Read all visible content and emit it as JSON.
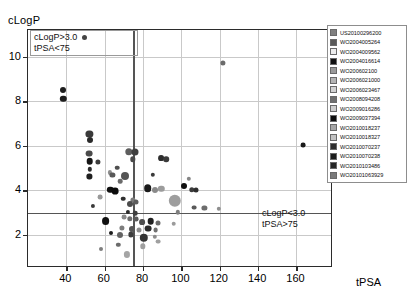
{
  "chart_data": {
    "type": "scatter",
    "title": "",
    "xlabel": "tPSA",
    "ylabel": "cLogP",
    "xlim": [
      20,
      178
    ],
    "ylim": [
      0.6,
      11.2
    ],
    "xticks": [
      40,
      60,
      80,
      100,
      120,
      140,
      160
    ],
    "yticks": [
      2,
      4,
      6,
      8,
      10
    ],
    "grid": true,
    "legend_position": "right-outside",
    "thresholds": {
      "vertical_x": 75,
      "vertical_label": "tPSA = 75",
      "horizontal_y": 3.0,
      "horizontal_label": "cLogP = 3.0"
    },
    "annotations": [
      {
        "id": "upper-left",
        "line1": "cLogP>3.0",
        "line2": "tPSA<75",
        "marker": true
      },
      {
        "id": "lower-right",
        "line1": "cLogP<3.0",
        "line2": "tPSA>75",
        "marker": false
      }
    ],
    "legend_entries": [
      {
        "label": "US20100296200",
        "color": "#808080"
      },
      {
        "label": "WO2004005264",
        "color": "#5a5a5a"
      },
      {
        "label": "WO2004009562",
        "color": "#ededed"
      },
      {
        "label": "WO2004016614",
        "color": "#111111"
      },
      {
        "label": "WO200602100",
        "color": "#9a9a9a"
      },
      {
        "label": "WO2006021000",
        "color": "#b4b4b4"
      },
      {
        "label": "WO2006023467",
        "color": "#d2d2d2"
      },
      {
        "label": "WO2008094208",
        "color": "#6e6e6e"
      },
      {
        "label": "WO2009016286",
        "color": "#cccccc"
      },
      {
        "label": "WO2009037394",
        "color": "#0d0d0d"
      },
      {
        "label": "WO2010018237",
        "color": "#a6a6a6"
      },
      {
        "label": "WO2010018327",
        "color": "#c2c2c2"
      },
      {
        "label": "WO2010070237",
        "color": "#2e2e2e"
      },
      {
        "label": "WO2010070238",
        "color": "#1c1c1c"
      },
      {
        "label": "WO2010103486",
        "color": "#262626"
      },
      {
        "label": "WO20101063929",
        "color": "#7a7a7a"
      }
    ],
    "points": [
      {
        "x": 38.5,
        "y": 8.52,
        "r": 3.0,
        "c": "#1d1d1d"
      },
      {
        "x": 38.5,
        "y": 8.12,
        "r": 3.2,
        "c": "#1d1d1d"
      },
      {
        "x": 52.0,
        "y": 6.52,
        "r": 3.6,
        "c": "#3a3a3a"
      },
      {
        "x": 52.3,
        "y": 6.28,
        "r": 3.0,
        "c": "#2a2a2a"
      },
      {
        "x": 52.0,
        "y": 5.65,
        "r": 3.4,
        "c": "#4a4a4a"
      },
      {
        "x": 52.2,
        "y": 5.3,
        "r": 3.3,
        "c": "#151515"
      },
      {
        "x": 56.5,
        "y": 5.28,
        "r": 2.6,
        "c": "#3c3c3c"
      },
      {
        "x": 52.2,
        "y": 4.95,
        "r": 2.2,
        "c": "#2b2b2b"
      },
      {
        "x": 52.0,
        "y": 4.62,
        "r": 2.6,
        "c": "#1f1f1f"
      },
      {
        "x": 72.5,
        "y": 5.72,
        "r": 3.7,
        "c": "#5e5e5e"
      },
      {
        "x": 76.0,
        "y": 5.72,
        "r": 3.5,
        "c": "#3f3f3f"
      },
      {
        "x": 74.5,
        "y": 5.4,
        "r": 2.7,
        "c": "#4a4a4a"
      },
      {
        "x": 89.5,
        "y": 5.45,
        "r": 2.9,
        "c": "#2d2d2d"
      },
      {
        "x": 92.0,
        "y": 5.4,
        "r": 2.8,
        "c": "#3a3a3a"
      },
      {
        "x": 62.5,
        "y": 4.8,
        "r": 2.1,
        "c": "#8e8e8e"
      },
      {
        "x": 66.5,
        "y": 5.02,
        "r": 2.3,
        "c": "#4f4f4f"
      },
      {
        "x": 64.0,
        "y": 4.7,
        "r": 2.6,
        "c": "#585858"
      },
      {
        "x": 70.5,
        "y": 4.62,
        "r": 4.0,
        "c": "#545454"
      },
      {
        "x": 68.0,
        "y": 4.42,
        "r": 2.3,
        "c": "#6a6a6a"
      },
      {
        "x": 85.0,
        "y": 4.7,
        "r": 2.2,
        "c": "#3b3b3b"
      },
      {
        "x": 63.0,
        "y": 4.02,
        "r": 3.2,
        "c": "#101010"
      },
      {
        "x": 65.5,
        "y": 3.95,
        "r": 3.4,
        "c": "#0c0c0c"
      },
      {
        "x": 82.5,
        "y": 4.1,
        "r": 3.8,
        "c": "#1a1a1a"
      },
      {
        "x": 86.0,
        "y": 4.02,
        "r": 3.0,
        "c": "#8a8a8a"
      },
      {
        "x": 89.5,
        "y": 4.08,
        "r": 3.2,
        "c": "#9c9c9c"
      },
      {
        "x": 69.5,
        "y": 3.62,
        "r": 2.3,
        "c": "#2f2f2f"
      },
      {
        "x": 74.5,
        "y": 3.58,
        "r": 2.6,
        "c": "#7b7b7b"
      },
      {
        "x": 73.0,
        "y": 3.4,
        "r": 3.0,
        "c": "#4c4c4c"
      },
      {
        "x": 76.5,
        "y": 3.46,
        "r": 2.5,
        "c": "#5d5d5d"
      },
      {
        "x": 96.5,
        "y": 3.52,
        "r": 6.2,
        "c": "#9e9e9e"
      },
      {
        "x": 106.5,
        "y": 3.22,
        "r": 2.4,
        "c": "#5a5a5a"
      },
      {
        "x": 112.0,
        "y": 3.2,
        "r": 2.6,
        "c": "#6d6d6d"
      },
      {
        "x": 119.5,
        "y": 3.18,
        "r": 2.2,
        "c": "#8f8f8f"
      },
      {
        "x": 72.0,
        "y": 3.02,
        "r": 2.1,
        "c": "#2c2c2c"
      },
      {
        "x": 76.0,
        "y": 2.98,
        "r": 2.3,
        "c": "#3e3e3e"
      },
      {
        "x": 60.5,
        "y": 2.62,
        "r": 3.9,
        "c": "#101010"
      },
      {
        "x": 70.0,
        "y": 2.8,
        "r": 2.4,
        "c": "#8b8b8b"
      },
      {
        "x": 73.0,
        "y": 2.72,
        "r": 2.7,
        "c": "#6f6f6f"
      },
      {
        "x": 76.5,
        "y": 2.7,
        "r": 2.4,
        "c": "#5b5b5b"
      },
      {
        "x": 79.5,
        "y": 2.58,
        "r": 2.9,
        "c": "#4d4d4d"
      },
      {
        "x": 84.0,
        "y": 2.62,
        "r": 3.3,
        "c": "#212121"
      },
      {
        "x": 88.0,
        "y": 2.55,
        "r": 2.5,
        "c": "#6c6c6c"
      },
      {
        "x": 96.0,
        "y": 2.5,
        "r": 2.3,
        "c": "#9b9b9b"
      },
      {
        "x": 69.0,
        "y": 2.32,
        "r": 2.6,
        "c": "#7d7d7d"
      },
      {
        "x": 74.0,
        "y": 2.28,
        "r": 3.0,
        "c": "#555555"
      },
      {
        "x": 78.0,
        "y": 2.2,
        "r": 2.5,
        "c": "#8d8d8d"
      },
      {
        "x": 82.5,
        "y": 2.28,
        "r": 3.4,
        "c": "#2a2a2a"
      },
      {
        "x": 86.5,
        "y": 2.22,
        "r": 2.4,
        "c": "#707070"
      },
      {
        "x": 63.5,
        "y": 2.06,
        "r": 2.0,
        "c": "#1b1b1b"
      },
      {
        "x": 68.0,
        "y": 1.98,
        "r": 3.0,
        "c": "#636363"
      },
      {
        "x": 73.5,
        "y": 2.02,
        "r": 2.6,
        "c": "#3d3d3d"
      },
      {
        "x": 80.5,
        "y": 1.88,
        "r": 4.2,
        "c": "#343434"
      },
      {
        "x": 86.0,
        "y": 1.92,
        "r": 2.2,
        "c": "#8c8c8c"
      },
      {
        "x": 88.0,
        "y": 1.7,
        "r": 2.4,
        "c": "#a0a0a0"
      },
      {
        "x": 80.0,
        "y": 1.48,
        "r": 2.7,
        "c": "#9f9f9f"
      },
      {
        "x": 67.0,
        "y": 1.55,
        "r": 2.2,
        "c": "#6b6b6b"
      },
      {
        "x": 58.0,
        "y": 1.35,
        "r": 2.0,
        "c": "#7e7e7e"
      },
      {
        "x": 71.5,
        "y": 1.12,
        "r": 3.1,
        "c": "#a5a5a5"
      },
      {
        "x": 57.5,
        "y": 3.7,
        "r": 2.4,
        "c": "#999999"
      },
      {
        "x": 54.0,
        "y": 3.3,
        "r": 2.1,
        "c": "#3a3a3a"
      },
      {
        "x": 121.5,
        "y": 9.72,
        "r": 2.6,
        "c": "#6b6b6b"
      },
      {
        "x": 163.5,
        "y": 6.02,
        "r": 2.4,
        "c": "#1a1a1a"
      },
      {
        "x": 104.0,
        "y": 4.52,
        "r": 2.2,
        "c": "#868686"
      },
      {
        "x": 101.5,
        "y": 4.18,
        "r": 3.0,
        "c": "#0f0f0f"
      },
      {
        "x": 105.5,
        "y": 4.02,
        "r": 2.7,
        "c": "#3c3c3c"
      },
      {
        "x": 107.5,
        "y": 4.0,
        "r": 2.5,
        "c": "#2e2e2e"
      },
      {
        "x": 98.0,
        "y": 3.02,
        "r": 2.2,
        "c": "#7f7f7f"
      }
    ]
  }
}
